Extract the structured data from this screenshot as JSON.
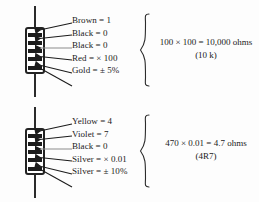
{
  "figure": {
    "background_color": "#fdfdfd",
    "ink_color": "#1c1c1c"
  },
  "diagrams": [
    {
      "id": "ten-kilohm",
      "resistor": {
        "band_count": 5,
        "bands": [
          "Brown",
          "Black",
          "Black",
          "Red",
          "Gold"
        ]
      },
      "labels": [
        "Brown = 1",
        "Black = 0",
        "Black = 0",
        "Red = × 100",
        "Gold = ± 5%"
      ],
      "result_main": "100 × 100 = 10,000 ohms",
      "result_sub": "(10 k)"
    },
    {
      "id": "four-point-seven-ohm",
      "resistor": {
        "band_count": 5,
        "bands": [
          "Yellow",
          "Violet",
          "Black",
          "Silver",
          "Silver"
        ]
      },
      "labels": [
        "Yellow = 4",
        "Violet = 7",
        "Black = 0",
        "Silver = × 0.01",
        "Silver = ± 10%"
      ],
      "result_main": "470 × 0.01 = 4.7 ohms",
      "result_sub": "(4R7)"
    }
  ]
}
